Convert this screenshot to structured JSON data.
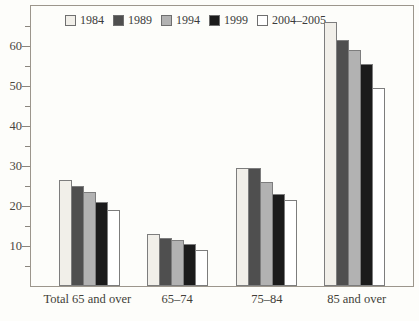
{
  "figure": {
    "background": "#fdfdfa",
    "axis_color": "#9c968c",
    "bar_border_color": "#7d7d7d",
    "text_color": "#3b3b3b"
  },
  "chart_data": {
    "type": "bar",
    "title": "",
    "xlabel": "",
    "ylabel": "",
    "grid": false,
    "legend_position": "top-left-inside",
    "ylim": [
      0,
      70
    ],
    "yticks_major": [
      10,
      20,
      30,
      40,
      50,
      60
    ],
    "yticks_minor": [
      5,
      15,
      25,
      35,
      45,
      55,
      65
    ],
    "categories": [
      "Total 65 and over",
      "65–74",
      "75–84",
      "85 and over"
    ],
    "series": [
      {
        "name": "1984",
        "color": "#f1efe9",
        "values": [
          26.5,
          13,
          29.5,
          66
        ]
      },
      {
        "name": "1989",
        "color": "#4f4f4f",
        "values": [
          25,
          12,
          29.5,
          61.5
        ]
      },
      {
        "name": "1994",
        "color": "#b2b2b2",
        "values": [
          23.5,
          11.5,
          26,
          59
        ]
      },
      {
        "name": "1999",
        "color": "#1b1b1b",
        "values": [
          21,
          10.5,
          23,
          55.5
        ]
      },
      {
        "name": "2004–2005",
        "color": "#ffffff",
        "values": [
          19,
          9,
          21.5,
          49.5
        ]
      }
    ]
  }
}
